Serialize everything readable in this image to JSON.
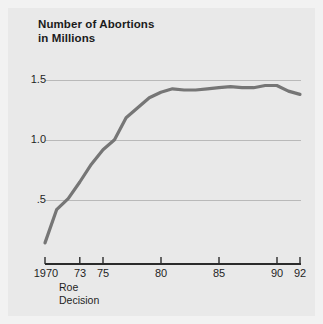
{
  "figure": {
    "background_color": "#e9e9e9",
    "paper_color": "#f2f2f2"
  },
  "title": {
    "line1": "Number of Abortions",
    "line2": "in Millions"
  },
  "annotation": {
    "line1": "Roe",
    "line2": "Decision",
    "at_year": 1973
  },
  "chart_data": {
    "type": "line",
    "title": "Number of Abortions in Millions",
    "xlabel": "",
    "ylabel": "",
    "xlim": [
      1970,
      1992
    ],
    "ylim": [
      0,
      1.75
    ],
    "grid": true,
    "grid_y": [
      0.5,
      1.0,
      1.5
    ],
    "legend": "none",
    "line_color": "#767676",
    "line_width": 3.2,
    "x_tick_values": [
      1970,
      1973,
      1975,
      1980,
      1985,
      1990,
      1992
    ],
    "x_tick_labels": [
      "1970",
      "73",
      "75",
      "80",
      "85",
      "90",
      "92"
    ],
    "y_tick_values": [
      0.5,
      1.0,
      1.5
    ],
    "y_tick_labels": [
      ".5",
      "1.0",
      "1.5"
    ],
    "x": [
      1970,
      1971,
      1972,
      1973,
      1974,
      1975,
      1976,
      1977,
      1978,
      1979,
      1980,
      1981,
      1982,
      1983,
      1984,
      1985,
      1986,
      1987,
      1988,
      1989,
      1990,
      1991,
      1992
    ],
    "values": [
      0.19,
      0.49,
      0.59,
      0.74,
      0.9,
      1.03,
      1.12,
      1.32,
      1.41,
      1.5,
      1.55,
      1.58,
      1.57,
      1.57,
      1.58,
      1.59,
      1.6,
      1.59,
      1.59,
      1.61,
      1.61,
      1.56,
      1.53
    ],
    "series": [
      {
        "name": "Number of Abortions in Millions",
        "values": [
          0.19,
          0.49,
          0.59,
          0.74,
          0.9,
          1.03,
          1.12,
          1.32,
          1.41,
          1.5,
          1.55,
          1.58,
          1.57,
          1.57,
          1.58,
          1.59,
          1.6,
          1.59,
          1.59,
          1.61,
          1.61,
          1.56,
          1.53
        ]
      }
    ]
  },
  "axis": {
    "y_ticks": [
      {
        "label": "1.5",
        "value": 1.5
      },
      {
        "label": "1.0",
        "value": 1.0
      },
      {
        "label": ".5",
        "value": 0.5
      }
    ],
    "x_ticks": [
      {
        "label": "1970",
        "value": 1970
      },
      {
        "label": "73",
        "value": 1973
      },
      {
        "label": "75",
        "value": 1975
      },
      {
        "label": "80",
        "value": 1980
      },
      {
        "label": "85",
        "value": 1985
      },
      {
        "label": "90",
        "value": 1990
      },
      {
        "label": "92",
        "value": 1992
      }
    ]
  }
}
